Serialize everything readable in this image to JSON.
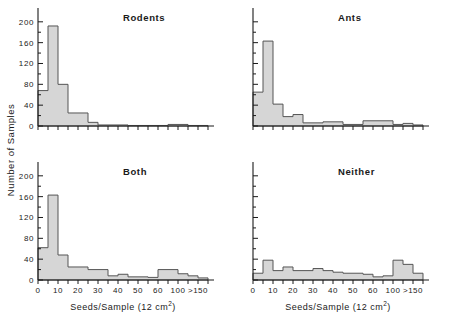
{
  "figure": {
    "ylabel": "Number of Samples",
    "xlabel_main": "Seeds/Sample (12  cm",
    "xlabel_sup": "2",
    "xlabel_tail": ")",
    "bar_fill": "#d6d6d6",
    "bar_stroke": "#555555",
    "axis_color": "#1a1a1a"
  },
  "chart_data": [
    {
      "type": "bar",
      "title": "Rodents",
      "panel": "top-left",
      "xlabel": "Seeds/Sample (12 cm2)",
      "ylabel": "Number of Samples",
      "ylim": [
        0,
        215
      ],
      "yticks": [
        0,
        40,
        80,
        120,
        160,
        200
      ],
      "ytick_labels": [
        "0",
        "40",
        "80",
        "120",
        "160",
        "200"
      ],
      "xtick_labels": [
        "0",
        "10",
        "20",
        "30",
        "40",
        "50",
        "60",
        "100",
        ">150"
      ],
      "xtick_positions": [
        0,
        2,
        4,
        6,
        8,
        10,
        12,
        14,
        16
      ],
      "bin_edges": [
        0,
        1,
        2,
        3,
        4,
        5,
        6,
        7,
        8,
        9,
        10,
        11,
        12,
        13,
        14,
        15,
        16,
        17
      ],
      "values": [
        68,
        192,
        80,
        25,
        25,
        7,
        2,
        2,
        2,
        1,
        1,
        1,
        1,
        3,
        3,
        1,
        1
      ],
      "grid": false,
      "legend": "none"
    },
    {
      "type": "bar",
      "title": "Ants",
      "panel": "top-right",
      "xlabel": "Seeds/Sample (12 cm2)",
      "ylabel": "Number of Samples",
      "ylim": [
        0,
        215
      ],
      "yticks": [
        0,
        40,
        80,
        120,
        160,
        200
      ],
      "ytick_labels": [
        "",
        "",
        "",
        "",
        "",
        ""
      ],
      "xtick_labels": [
        "0",
        "10",
        "20",
        "30",
        "40",
        "50",
        "60",
        "100",
        ">150"
      ],
      "xtick_positions": [
        0,
        2,
        4,
        6,
        8,
        10,
        12,
        14,
        16
      ],
      "bin_edges": [
        0,
        1,
        2,
        3,
        4,
        5,
        6,
        7,
        8,
        9,
        10,
        11,
        12,
        13,
        14,
        15,
        16,
        17
      ],
      "values": [
        65,
        163,
        42,
        18,
        22,
        6,
        6,
        8,
        8,
        3,
        3,
        10,
        10,
        10,
        3,
        5,
        2
      ],
      "grid": false,
      "legend": "none"
    },
    {
      "type": "bar",
      "title": "Both",
      "panel": "bottom-left",
      "xlabel": "Seeds/Sample (12 cm2)",
      "ylabel": "Number of Samples",
      "ylim": [
        0,
        215
      ],
      "yticks": [
        0,
        40,
        80,
        120,
        160,
        200
      ],
      "ytick_labels": [
        "0",
        "40",
        "80",
        "120",
        "160",
        "200"
      ],
      "xtick_labels": [
        "0",
        "10",
        "20",
        "30",
        "40",
        "50",
        "60",
        "100",
        ">150"
      ],
      "xtick_positions": [
        0,
        2,
        4,
        6,
        8,
        10,
        12,
        14,
        16
      ],
      "bin_edges": [
        0,
        1,
        2,
        3,
        4,
        5,
        6,
        7,
        8,
        9,
        10,
        11,
        12,
        13,
        14,
        15,
        16,
        17
      ],
      "values": [
        62,
        163,
        48,
        25,
        25,
        20,
        20,
        8,
        11,
        6,
        6,
        5,
        20,
        20,
        12,
        8,
        4
      ],
      "grid": false,
      "legend": "none"
    },
    {
      "type": "bar",
      "title": "Neither",
      "panel": "bottom-right",
      "xlabel": "Seeds/Sample (12 cm2)",
      "ylabel": "Number of Samples",
      "ylim": [
        0,
        215
      ],
      "yticks": [
        0,
        40,
        80,
        120,
        160,
        200
      ],
      "ytick_labels": [
        "",
        "",
        "",
        "",
        "",
        ""
      ],
      "xtick_labels": [
        "0",
        "10",
        "20",
        "30",
        "40",
        "50",
        "60",
        "100",
        ">150"
      ],
      "xtick_positions": [
        0,
        2,
        4,
        6,
        8,
        10,
        12,
        14,
        16
      ],
      "bin_edges": [
        0,
        1,
        2,
        3,
        4,
        5,
        6,
        7,
        8,
        9,
        10,
        11,
        12,
        13,
        14,
        15,
        16,
        17
      ],
      "values": [
        13,
        38,
        18,
        25,
        18,
        18,
        22,
        18,
        15,
        13,
        13,
        11,
        6,
        8,
        38,
        30,
        13
      ],
      "grid": false,
      "legend": "none"
    }
  ]
}
